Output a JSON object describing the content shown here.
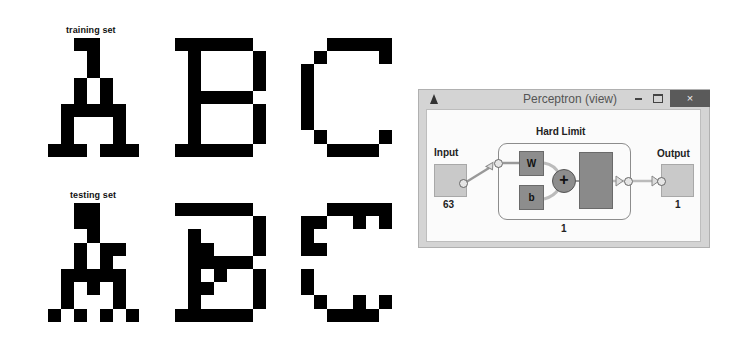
{
  "figure": {
    "training_label": "training set",
    "testing_label": "testing set",
    "grid": {
      "cols": 7,
      "rows": 9
    },
    "training": [
      {
        "letter": "A",
        "rows": [
          "..##...",
          "...#...",
          "...#...",
          "..#.#..",
          "..#.#..",
          ".#####.",
          ".#...#.",
          ".#...#.",
          "###.###"
        ]
      },
      {
        "letter": "B",
        "rows": [
          "######.",
          ".#....#",
          ".#....#",
          ".#....#",
          ".#####.",
          ".#....#",
          ".#....#",
          ".#....#",
          "######."
        ]
      },
      {
        "letter": "C",
        "rows": [
          "..#####",
          ".#....#",
          "#......",
          "#......",
          "#......",
          "#......",
          "#......",
          ".#....#",
          "..####."
        ]
      }
    ],
    "testing": [
      {
        "letter": "A",
        "rows": [
          "..##...",
          "..##...",
          "...#...",
          "..#.##.",
          "..#.#..",
          ".#####.",
          ".#.#.#.",
          ".#...#.",
          "#.#.#.#"
        ]
      },
      {
        "letter": "B",
        "rows": [
          "######.",
          "......#",
          ".#....#",
          ".##...#",
          ".#####.",
          ".#.#..#",
          ".##...#",
          ".#....#",
          "######."
        ]
      },
      {
        "letter": "C",
        "rows": [
          "..#####",
          "##..#.#",
          "#......",
          "##.....",
          ".......",
          "#......",
          "#......",
          ".#..#.#",
          "..####."
        ]
      }
    ]
  },
  "window": {
    "title": "Perceptron (view)",
    "app_icon": "matlab-icon",
    "minimize_icon": "minimize-icon",
    "maximize_icon": "maximize-icon",
    "close_label": "×"
  },
  "network": {
    "input_label": "Input",
    "input_size": "63",
    "layer_label": "Hard Limit",
    "weight_label": "W",
    "bias_label": "b",
    "sum_symbol": "+",
    "layer_size": "1",
    "output_label": "Output",
    "output_size": "1"
  },
  "colors": {
    "pixel_on": "#000000",
    "block_fill": "#8d8d8d",
    "io_fill": "#c9c9c9",
    "close_button": "#5a5a5a"
  }
}
